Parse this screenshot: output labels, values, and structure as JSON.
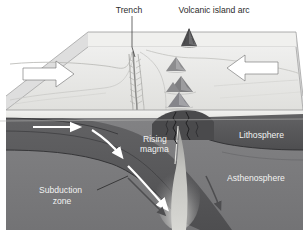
{
  "figure": {
    "kind": "block-diagram",
    "width": 303,
    "height": 230,
    "background_color": "#ffffff"
  },
  "labels": {
    "trench": "Trench",
    "volcanic_island_arc": "Volcanic island arc",
    "rising_magma_line1": "Rising",
    "rising_magma_line2": "magma",
    "lithosphere": "Lithosphere",
    "asthenosphere": "Asthenosphere",
    "subduction_zone_line1": "Subduction",
    "subduction_zone_line2": "zone"
  },
  "colors": {
    "ocean_surface": "#ececeb",
    "seafloor_top": "#e6e6e4",
    "block_side": "#d8d8d6",
    "water_column": "#eeeeec",
    "lithosphere": "#58585a",
    "lithosphere_dark": "#3c3c3e",
    "asthenosphere": "#7c7c7e",
    "magma": "#cfcfcb",
    "volcano_dark": "#4a4a4c",
    "seamount": "#8d8d8f",
    "arrow_white": "#ffffff",
    "arrow_outline": "#6b6b6b",
    "label_dark": "#2b2b2b",
    "label_light": "#f2f2f2"
  },
  "arrows": {
    "plate_motion_left": "right-arrow",
    "plate_motion_right": "left-arrow",
    "slab_motion_1": "slab-arrow-horizontal",
    "slab_motion_2": "slab-arrow-curving",
    "slab_motion_3": "slab-arrow-descending",
    "mantle_flow_left": "mantle-convection-arrow-left",
    "mantle_flow_right": "mantle-convection-arrow-right"
  }
}
